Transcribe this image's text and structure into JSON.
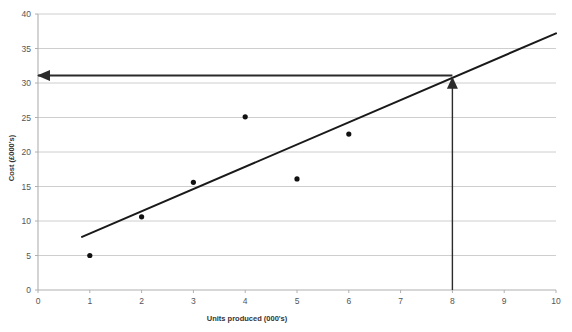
{
  "chart_data": {
    "type": "scatter",
    "title": "",
    "subtitle": "",
    "xlabel": "Units produced (000's)",
    "ylabel": "Cost (£000's)",
    "xlim": [
      0,
      10
    ],
    "ylim": [
      0,
      40
    ],
    "grid": true,
    "grid_axis": "y",
    "legend": false,
    "legend_position": "none",
    "x_ticks": [
      0,
      1,
      2,
      3,
      4,
      5,
      6,
      7,
      8,
      9,
      10
    ],
    "x_tick_labels": [
      "0",
      "1",
      "2",
      "3",
      "4",
      "5",
      "6",
      "7",
      "8",
      "9",
      "10"
    ],
    "y_ticks": [
      0,
      5,
      10,
      15,
      20,
      25,
      30,
      35,
      40
    ],
    "y_tick_labels": [
      "0",
      "5",
      "10",
      "15",
      "20",
      "25",
      "30",
      "35",
      "40"
    ],
    "series": [
      {
        "name": "Observed cost",
        "type": "scatter",
        "marker": "circle",
        "color": "#111111",
        "x": [
          1,
          2,
          3,
          4,
          5,
          6
        ],
        "y": [
          5.0,
          10.6,
          15.6,
          25.1,
          16.1,
          22.6
        ],
        "points": [
          {
            "x": 1,
            "y": 5.0
          },
          {
            "x": 2,
            "y": 10.6
          },
          {
            "x": 3,
            "y": 15.6
          },
          {
            "x": 4,
            "y": 25.1
          },
          {
            "x": 5,
            "y": 16.1
          },
          {
            "x": 6,
            "y": 22.6
          }
        ]
      },
      {
        "name": "Line of best fit",
        "type": "line",
        "color": "#1a1a1a",
        "x": [
          0.85,
          10.0
        ],
        "y": [
          7.7,
          37.2
        ]
      }
    ],
    "annotations": [
      {
        "name": "vertical-reading-arrow",
        "type": "arrow",
        "from": {
          "x": 8,
          "y": 0
        },
        "to": {
          "x": 8,
          "y": 30.6
        },
        "color": "#2b2b2b",
        "label": ""
      },
      {
        "name": "horizontal-reading-arrow",
        "type": "arrow",
        "from": {
          "x": 8,
          "y": 31.1
        },
        "to": {
          "x": 0,
          "y": 31.1
        },
        "color": "#2b2b2b",
        "label": ""
      }
    ]
  },
  "colors": {
    "background": "#ffffff",
    "grid": "#c8c8c8",
    "axis": "#b0b0b0",
    "point": "#111111",
    "trend": "#1a1a1a",
    "annotation": "#2b2b2b"
  }
}
